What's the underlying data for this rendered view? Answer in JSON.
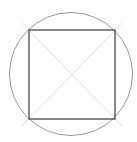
{
  "diagram": {
    "canvas": {
      "width": 137,
      "height": 142,
      "background": "#ffffff"
    },
    "circle": {
      "cx": 71,
      "cy": 74,
      "r": 61.5,
      "stroke": "#9a9a9a",
      "stroke_width": 1
    },
    "square": {
      "x1": 29,
      "y1": 30,
      "x2": 115,
      "y2": 119,
      "stroke": "#555555",
      "stroke_width": 1.4
    },
    "diagonals": [
      {
        "x1": 22,
        "y1": 23,
        "x2": 122,
        "y2": 126,
        "stroke": "#e2e2e2",
        "stroke_width": 1
      },
      {
        "x1": 122,
        "y1": 23,
        "x2": 22,
        "y2": 126,
        "stroke": "#e2e2e2",
        "stroke_width": 1
      }
    ]
  }
}
